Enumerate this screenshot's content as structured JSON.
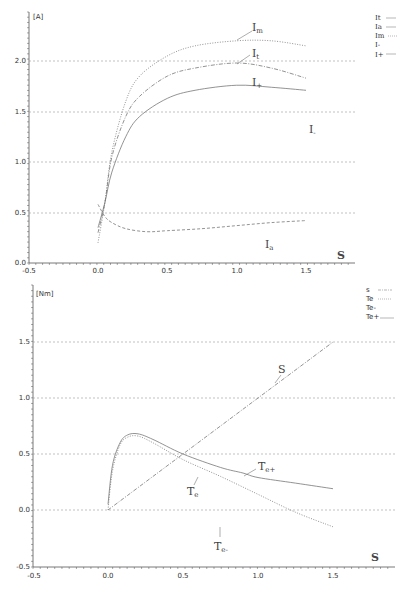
{
  "chart_data": [
    {
      "type": "line",
      "title": "",
      "xlabel": "S",
      "ylabel": "[A]",
      "xlim": [
        -0.5,
        1.9
      ],
      "ylim": [
        0.0,
        2.4
      ],
      "x_ticks": [
        "-0.5",
        "0.0",
        "0.5",
        "1.0",
        "1.5"
      ],
      "y_ticks": [
        "0.0",
        "0.5",
        "1.0",
        "1.5",
        "2.0"
      ],
      "grid": "horizontal dashed",
      "legend_position": "top-right",
      "legend": [
        "It",
        "Ia",
        "Im",
        "I-",
        "I+"
      ],
      "series": [
        {
          "name": "Im",
          "style": "dotted",
          "x": [
            0.0,
            0.05,
            0.1,
            0.2,
            0.3,
            0.5,
            0.7,
            1.0,
            1.25,
            1.5
          ],
          "y": [
            0.2,
            0.6,
            1.1,
            1.6,
            1.85,
            2.05,
            2.15,
            2.2,
            2.2,
            2.15
          ]
        },
        {
          "name": "It",
          "style": "dash-dot",
          "x": [
            0.0,
            0.05,
            0.1,
            0.2,
            0.3,
            0.5,
            0.7,
            1.0,
            1.25,
            1.5
          ],
          "y": [
            0.3,
            0.6,
            1.05,
            1.45,
            1.65,
            1.85,
            1.93,
            1.98,
            1.93,
            1.83
          ]
        },
        {
          "name": "I+",
          "style": "solid",
          "x": [
            0.0,
            0.05,
            0.1,
            0.2,
            0.3,
            0.5,
            0.7,
            1.0,
            1.25,
            1.5
          ],
          "y": [
            0.35,
            0.6,
            0.9,
            1.25,
            1.45,
            1.63,
            1.71,
            1.76,
            1.74,
            1.71
          ]
        },
        {
          "name": "Ia",
          "style": "dashed",
          "x": [
            0.0,
            0.05,
            0.1,
            0.2,
            0.35,
            0.5,
            0.75,
            1.0,
            1.25,
            1.5
          ],
          "y": [
            0.58,
            0.46,
            0.4,
            0.34,
            0.31,
            0.32,
            0.34,
            0.37,
            0.4,
            0.42
          ]
        }
      ],
      "annotations": [
        {
          "text": "I",
          "sub": "m",
          "x": 1.1,
          "y": 2.27
        },
        {
          "text": "I",
          "sub": "t",
          "x": 1.1,
          "y": 2.04
        },
        {
          "text": "I",
          "sub": "+",
          "x": 1.1,
          "y": 1.8
        },
        {
          "text": "I",
          "sub": "a",
          "x": 1.25,
          "y": 0.46
        },
        {
          "text": "I",
          "sub": "-",
          "x": 1.75,
          "y": 1.2
        }
      ]
    },
    {
      "type": "line",
      "title": "",
      "xlabel": "S",
      "ylabel": "[Nm]",
      "xlim": [
        -0.5,
        1.9
      ],
      "ylim": [
        -0.5,
        1.9
      ],
      "x_ticks": [
        "-0.5",
        "0.0",
        "0.5",
        "1.0",
        "1.5"
      ],
      "y_ticks": [
        "-0.5",
        "0.0",
        "0.5",
        "1.0",
        "1.5"
      ],
      "grid": "horizontal dashed",
      "legend_position": "top-right",
      "legend": [
        "s",
        "Te",
        "Te-",
        "Te+"
      ],
      "series": [
        {
          "name": "s",
          "style": "dash-dot",
          "x": [
            0.0,
            1.5
          ],
          "y": [
            0.0,
            1.5
          ]
        },
        {
          "name": "Te",
          "style": "dotted",
          "x": [
            0.0,
            0.03,
            0.08,
            0.13,
            0.2,
            0.3,
            0.5,
            0.75,
            1.0,
            1.25,
            1.5
          ],
          "y": [
            0.0,
            0.35,
            0.58,
            0.65,
            0.66,
            0.6,
            0.45,
            0.3,
            0.14,
            -0.02,
            -0.15
          ]
        },
        {
          "name": "Te+",
          "style": "solid",
          "x": [
            0.0,
            0.03,
            0.08,
            0.13,
            0.2,
            0.3,
            0.5,
            0.75,
            0.9,
            1.0,
            1.25,
            1.5
          ],
          "y": [
            0.05,
            0.4,
            0.6,
            0.67,
            0.68,
            0.63,
            0.5,
            0.38,
            0.33,
            0.29,
            0.24,
            0.19
          ]
        }
      ],
      "annotations": [
        {
          "text": "S",
          "sub": "",
          "x": 1.12,
          "y": 1.23
        },
        {
          "text": "T",
          "sub": "e+",
          "x": 1.05,
          "y": 0.38
        },
        {
          "text": "T",
          "sub": "e",
          "x": 0.35,
          "y": 0.2
        },
        {
          "text": "T",
          "sub": "e-",
          "x": 0.7,
          "y": -0.37
        }
      ]
    }
  ],
  "top_chart": {
    "unit_label": "[A]",
    "x_var": "S",
    "x_tick_labels": [
      "-0.5",
      "0.0",
      "0.5",
      "1.0",
      "1.5"
    ],
    "y_tick_labels": [
      "0.0",
      "0.5",
      "1.0",
      "1.5",
      "2.0"
    ],
    "legend": [
      {
        "label": "It",
        "style": "solid"
      },
      {
        "label": "Ia",
        "style": "solid"
      },
      {
        "label": "Im",
        "style": "dotted"
      },
      {
        "label": "I-",
        "style": "none"
      },
      {
        "label": "I+",
        "style": "solid"
      }
    ],
    "annotations": {
      "im": {
        "main": "I",
        "sub": "m"
      },
      "it": {
        "main": "I",
        "sub": "t"
      },
      "iplus": {
        "main": "I",
        "sub": "+"
      },
      "ia": {
        "main": "I",
        "sub": "a"
      },
      "iminus": {
        "main": "I",
        "sub": "-"
      }
    }
  },
  "bottom_chart": {
    "unit_label": "[Nm]",
    "x_var": "S",
    "x_tick_labels": [
      "-0.5",
      "0.0",
      "0.5",
      "1.0",
      "1.5"
    ],
    "y_tick_labels": [
      "-0.5",
      "0.0",
      "0.5",
      "1.0",
      "1.5"
    ],
    "legend": [
      {
        "label": "s",
        "style": "dash-dot"
      },
      {
        "label": "Te",
        "style": "dotted"
      },
      {
        "label": "Te-",
        "style": "none"
      },
      {
        "label": "Te+",
        "style": "solid"
      }
    ],
    "annotations": {
      "s": {
        "main": "S",
        "sub": ""
      },
      "teplus": {
        "main": "T",
        "sub": "e+"
      },
      "te": {
        "main": "T",
        "sub": "e"
      },
      "teminus": {
        "main": "T",
        "sub": "e-"
      }
    }
  }
}
